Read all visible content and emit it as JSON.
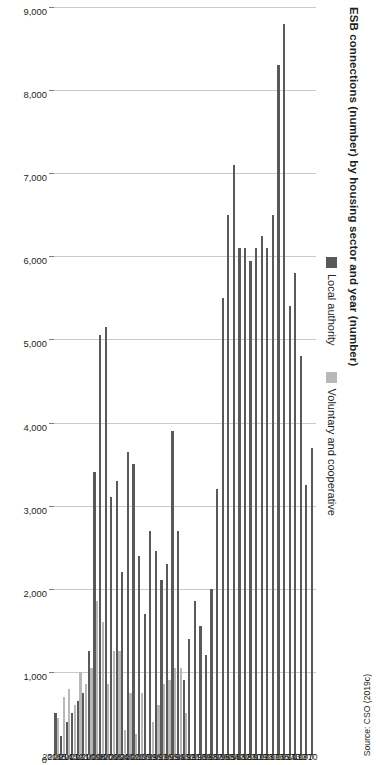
{
  "figure": {
    "title": "ESB connections (number) by housing sector and year (number)",
    "source": "Source: CSO (2019c)"
  },
  "legend": {
    "position": "top",
    "items": [
      {
        "label": "Local authority",
        "color": "#595959",
        "key": "local_authority"
      },
      {
        "label": "Voluntary and cooperative",
        "color": "#b8b8b8",
        "key": "voluntary_cooperative"
      }
    ]
  },
  "axis": {
    "value_ticks": [
      "0",
      "1,000",
      "2,000",
      "3,000",
      "4,000",
      "5,000",
      "6,000",
      "7,000",
      "8,000",
      "9,000"
    ],
    "value_min": 0,
    "value_max": 9000,
    "value_step": 1000,
    "grid": true
  },
  "chart_data": {
    "type": "bar",
    "orientation": "horizontal",
    "title": "ESB connections (number) by housing sector and year (number)",
    "xlabel": "",
    "ylabel": "",
    "xlim": [
      0,
      9000
    ],
    "grid": true,
    "legend_position": "top",
    "categories": [
      "1970",
      "1971",
      "1972",
      "1973",
      "1974",
      "1975",
      "1976",
      "1977",
      "1978",
      "1979",
      "1980",
      "1981",
      "1982",
      "1983",
      "1984",
      "1985",
      "1986",
      "1987",
      "1988",
      "1989",
      "1990",
      "1991",
      "1992",
      "1993",
      "1994",
      "1995",
      "1996",
      "1997",
      "1998",
      "1999",
      "2000",
      "2001",
      "2002",
      "2003",
      "2004",
      "2005",
      "2006",
      "2007",
      "2008",
      "2009",
      "2010",
      "2011",
      "2012",
      "2013",
      "2014",
      "2015",
      "2016"
    ],
    "series": [
      {
        "name": "Local authority",
        "color": "#595959",
        "values": [
          3700,
          3250,
          4800,
          5800,
          5400,
          8800,
          8300,
          6500,
          6100,
          6250,
          6100,
          5950,
          6100,
          6100,
          7100,
          6500,
          5500,
          3200,
          2000,
          1200,
          1550,
          1850,
          1400,
          900,
          2700,
          3900,
          2300,
          2100,
          2450,
          2700,
          1700,
          2400,
          3500,
          3650,
          2200,
          3300,
          3100,
          5150,
          5050,
          3400,
          1250,
          750,
          650,
          500,
          400,
          230,
          500
        ]
      },
      {
        "name": "Voluntary and cooperative",
        "color": "#b8b8b8",
        "values": [
          0,
          0,
          0,
          0,
          0,
          0,
          0,
          0,
          0,
          0,
          0,
          0,
          0,
          0,
          0,
          0,
          0,
          0,
          0,
          0,
          0,
          0,
          0,
          500,
          1050,
          1050,
          900,
          850,
          600,
          400,
          0,
          750,
          250,
          750,
          300,
          1250,
          1250,
          850,
          1600,
          1850,
          1050,
          850,
          1000,
          600,
          800,
          700,
          450
        ]
      }
    ]
  }
}
